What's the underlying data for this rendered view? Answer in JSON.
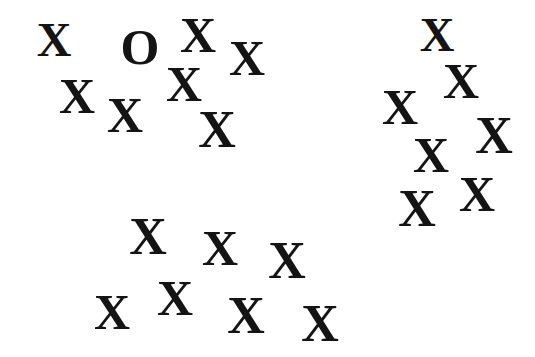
{
  "stimuli": [
    {
      "glyph": "X",
      "x": 54,
      "y": 40,
      "size": 48
    },
    {
      "glyph": "O",
      "x": 140,
      "y": 47,
      "size": 50
    },
    {
      "glyph": "X",
      "x": 198,
      "y": 35,
      "size": 50
    },
    {
      "glyph": "X",
      "x": 247,
      "y": 58,
      "size": 50
    },
    {
      "glyph": "X",
      "x": 77,
      "y": 96,
      "size": 50
    },
    {
      "glyph": "X",
      "x": 125,
      "y": 115,
      "size": 50
    },
    {
      "glyph": "X",
      "x": 184,
      "y": 84,
      "size": 50
    },
    {
      "glyph": "X",
      "x": 217,
      "y": 130,
      "size": 52
    },
    {
      "glyph": "X",
      "x": 437,
      "y": 35,
      "size": 48
    },
    {
      "glyph": "X",
      "x": 461,
      "y": 81,
      "size": 50
    },
    {
      "glyph": "X",
      "x": 400,
      "y": 107,
      "size": 50
    },
    {
      "glyph": "X",
      "x": 494,
      "y": 136,
      "size": 52
    },
    {
      "glyph": "X",
      "x": 431,
      "y": 155,
      "size": 50
    },
    {
      "glyph": "X",
      "x": 477,
      "y": 194,
      "size": 50
    },
    {
      "glyph": "X",
      "x": 417,
      "y": 209,
      "size": 52
    },
    {
      "glyph": "X",
      "x": 148,
      "y": 237,
      "size": 52
    },
    {
      "glyph": "X",
      "x": 220,
      "y": 248,
      "size": 50
    },
    {
      "glyph": "X",
      "x": 287,
      "y": 261,
      "size": 52
    },
    {
      "glyph": "X",
      "x": 112,
      "y": 312,
      "size": 50
    },
    {
      "glyph": "X",
      "x": 175,
      "y": 298,
      "size": 50
    },
    {
      "glyph": "X",
      "x": 246,
      "y": 316,
      "size": 52
    },
    {
      "glyph": "X",
      "x": 320,
      "y": 324,
      "size": 52
    }
  ],
  "colors": {
    "background": "#ffffff",
    "glyph": "#141414"
  }
}
